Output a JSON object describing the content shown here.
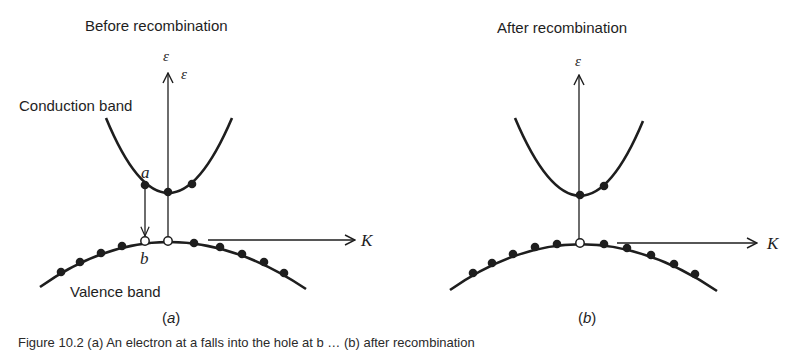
{
  "panels": [
    {
      "id": "a",
      "title": "Before recombination",
      "sublabel_open": "(",
      "sublabel_letter": "a",
      "sublabel_close": ")",
      "axis_energy_label": "ε",
      "axis_energy_label_2": "ε",
      "axis_k_label": "K",
      "conduction_band_label": "Conduction band",
      "valence_band_label": "Valence band",
      "point_a_label": "a",
      "point_b_label": "b",
      "conduction_electrons": 3,
      "valence_holes": 2,
      "valence_electrons": 9
    },
    {
      "id": "b",
      "title": "After recombination",
      "sublabel_open": "(",
      "sublabel_letter": "b",
      "sublabel_close": ")",
      "axis_energy_label": "ε",
      "axis_k_label": "K",
      "conduction_electrons": 2,
      "valence_holes": 1,
      "valence_electrons": 10
    }
  ],
  "caption": "Figure 10.2 (a) An electron at a falls into the hole at b … (b) after recombination"
}
